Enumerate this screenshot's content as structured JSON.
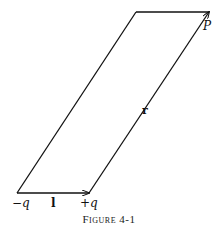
{
  "figure": {
    "caption": "Figure 4-1",
    "stroke_color": "#111111",
    "vertices": {
      "bottom_left": [
        17,
        193
      ],
      "bottom_right": [
        89,
        193
      ],
      "top_left": [
        136,
        12
      ],
      "top_right": [
        209,
        12
      ]
    },
    "labels": {
      "minus_q": "−q",
      "plus_q": "+q",
      "l_vector": "l",
      "r_vector": "r",
      "point": "P"
    }
  }
}
